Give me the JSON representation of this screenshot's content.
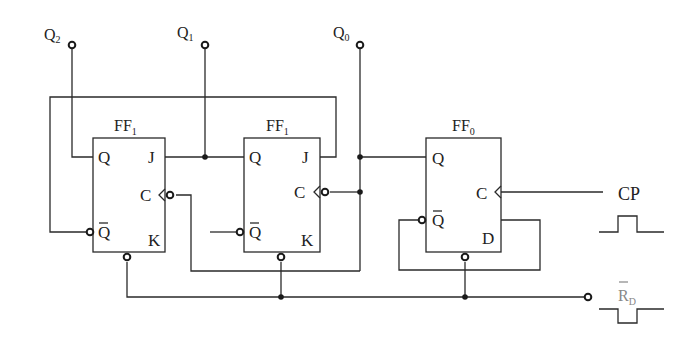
{
  "diagram": {
    "type": "sequential logic circuit (counter)",
    "outputs": [
      {
        "label": "Q",
        "sub": "2"
      },
      {
        "label": "Q",
        "sub": "1"
      },
      {
        "label": "Q",
        "sub": "0"
      }
    ],
    "flip_flops": [
      {
        "name": "FF",
        "sub": "1",
        "kind": "JK",
        "pins": {
          "q": "Q",
          "qbar": "Q",
          "j": "J",
          "c": "C",
          "k": "K"
        }
      },
      {
        "name": "FF",
        "sub": "1",
        "kind": "JK",
        "pins": {
          "q": "Q",
          "qbar": "Q",
          "j": "J",
          "c": "C",
          "k": "K"
        }
      },
      {
        "name": "FF",
        "sub": "0",
        "kind": "D",
        "pins": {
          "q": "Q",
          "qbar": "Q",
          "c": "C",
          "d": "D"
        }
      }
    ],
    "inputs": {
      "clock": {
        "label": "CP"
      },
      "reset": {
        "label": "R",
        "sub": "D"
      }
    },
    "colors": {
      "wire": "#2a2a2a",
      "reset_label": "#888888"
    }
  }
}
